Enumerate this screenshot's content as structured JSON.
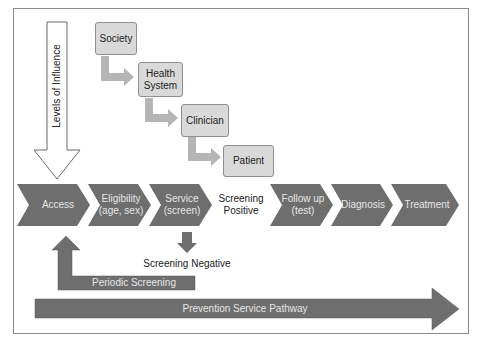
{
  "levels_of_influence": {
    "label": "Levels of Influence",
    "levels": [
      {
        "label": "Society"
      },
      {
        "label": "Health\nSystem",
        "line1": "Health",
        "line2": "System"
      },
      {
        "label": "Clinician"
      },
      {
        "label": "Patient"
      }
    ]
  },
  "pathway_steps": [
    {
      "line1": "Access",
      "line2": ""
    },
    {
      "line1": "Eligibility",
      "line2": "(age, sex)"
    },
    {
      "line1": "Service",
      "line2": "(screen)"
    },
    {
      "line1": "Follow up",
      "line2": "(test)"
    },
    {
      "line1": "Diagnosis",
      "line2": ""
    },
    {
      "line1": "Treatment",
      "line2": ""
    }
  ],
  "screening_positive": {
    "line1": "Screening",
    "line2": "Positive"
  },
  "screening_negative": "Screening Negative",
  "periodic_screening": "Periodic Screening",
  "prevention_pathway": "Prevention Service Pathway",
  "colors": {
    "chevron_fill": "#6e6e6e",
    "box_fill": "#d9d9d9",
    "box_border": "#8f8f8f",
    "connector_arrow": "#b5b5b5",
    "frame_border": "#8a8a8a",
    "outline_arrow": "#6a6a6a"
  }
}
